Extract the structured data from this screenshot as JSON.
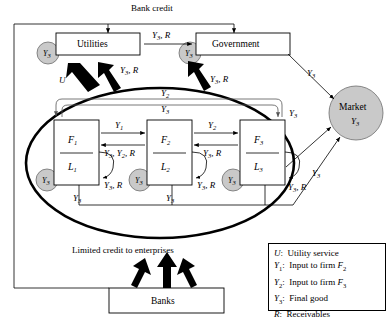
{
  "title": "Bank credit",
  "diagram": {
    "type": "flow-diagram",
    "top_label": "Bank credit",
    "bottom_label": "Limited credit to enterprises",
    "nodes": [
      {
        "id": "utilities",
        "label": "Utilities",
        "shape": "rect",
        "badge": "Y3"
      },
      {
        "id": "government",
        "label": "Government",
        "shape": "rect",
        "badge": "Y3"
      },
      {
        "id": "market",
        "label": "Market",
        "sublabel": "Y3",
        "shape": "circle",
        "fill": "#c9c9c9"
      },
      {
        "id": "banks",
        "label": "Banks",
        "shape": "rect"
      },
      {
        "id": "firm1",
        "label": "F1",
        "sublabel": "L1",
        "shape": "rect",
        "badge": "Y3"
      },
      {
        "id": "firm2",
        "label": "F2",
        "sublabel": "L2",
        "shape": "rect",
        "badge": "Y3"
      },
      {
        "id": "firm3",
        "label": "F3",
        "sublabel": "L3",
        "shape": "rect",
        "badge": "Y3"
      }
    ],
    "edge_labels": {
      "util_to_gov": "Y3, R",
      "util_down_U": "U",
      "util_up_y3r": "Y3, R",
      "gov_up_y3r": "Y3, R",
      "gov_to_market": "Y3",
      "firm3_to_market": "Y3",
      "rail_to_market": "Y3",
      "arc_outer": "Y2",
      "arc_inner": "Y3",
      "f1_to_f2": "Y1",
      "f2_to_f1": "Y3, Y2, R",
      "f2_to_f3": "Y2",
      "f3_to_f2": "Y3, R",
      "self_loop": "Y3, R",
      "drop": "Y3"
    }
  },
  "legend": {
    "rows": [
      {
        "sym": "U",
        "sub": "",
        "text": "Utility service",
        "tail": "",
        "tailsub": ""
      },
      {
        "sym": "Y",
        "sub": "1",
        "text": "Input to firm ",
        "tail": "F",
        "tailsub": "2"
      },
      {
        "sym": "Y",
        "sub": "2",
        "text": "Input to firm ",
        "tail": "F",
        "tailsub": "3"
      },
      {
        "sym": "Y",
        "sub": "3",
        "text": "Final good",
        "tail": "",
        "tailsub": ""
      },
      {
        "sym": "R",
        "sub": "",
        "text": "Receivables",
        "tail": "",
        "tailsub": ""
      }
    ]
  },
  "colors": {
    "badge_fill": "#c9c9c9",
    "market_fill": "#c9c9c9",
    "stroke": "#000000",
    "gray_stroke": "#555555",
    "background": "#ffffff"
  }
}
